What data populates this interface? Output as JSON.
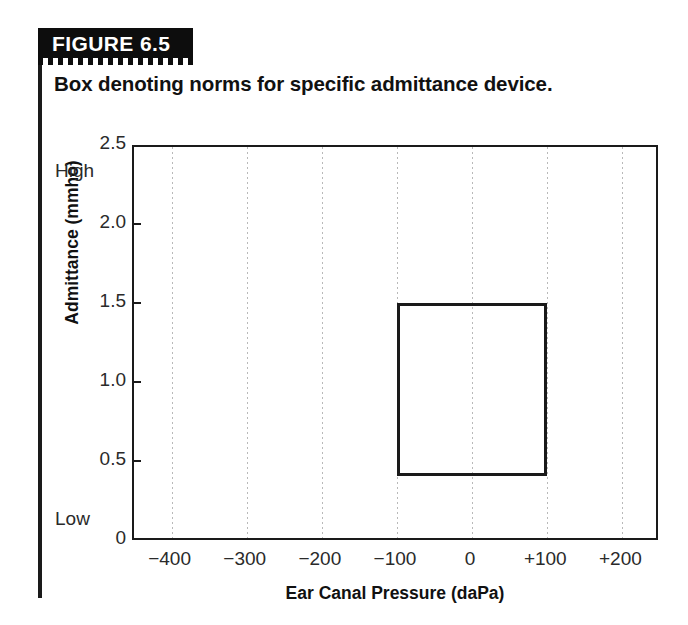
{
  "figure": {
    "banner_label": "FIGURE 6.5",
    "caption": "Box denoting norms for specific admittance device.",
    "banner_bg": "#0d0d0d",
    "banner_text_color": "#ffffff",
    "rule_color": "#1a1a1a"
  },
  "chart_data": {
    "type": "line",
    "title": "Box denoting norms for specific admittance device.",
    "subtitle": "",
    "xlabel": "Ear Canal Pressure (daPa)",
    "ylabel": "Admittance (mmho)",
    "xlim": [
      -450,
      250
    ],
    "ylim": [
      0,
      2.5
    ],
    "grid": "vertical-dotted",
    "legend": "none",
    "x_ticks": [
      -400,
      -300,
      -200,
      -100,
      0,
      100,
      200
    ],
    "x_tick_labels": [
      "−400",
      "−300",
      "−200",
      "−100",
      "0",
      "+100",
      "+200"
    ],
    "y_ticks": [
      0,
      0.5,
      1.0,
      1.5,
      2.0,
      2.5
    ],
    "y_tick_labels": [
      "0",
      "0.5",
      "1.0",
      "1.5",
      "2.0",
      "2.5"
    ],
    "y_axis_endpoint_labels": {
      "top": "High",
      "bottom": "Low"
    },
    "annotations": [
      {
        "name": "norm-box",
        "shape": "rectangle",
        "x_min": -100,
        "x_max": 100,
        "y_min": 0.42,
        "y_max": 1.51,
        "fill": "none",
        "stroke": "#1a1a1a"
      }
    ]
  }
}
